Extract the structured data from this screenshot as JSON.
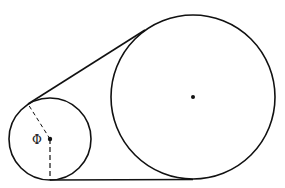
{
  "diagram": {
    "angle_label": "Φ",
    "colors": {
      "stroke": "#111111",
      "background": "#ffffff"
    },
    "small_circle": {
      "cx": 50,
      "cy": 139,
      "r": 41
    },
    "large_circle": {
      "cx": 193,
      "cy": 97,
      "r": 82
    }
  }
}
